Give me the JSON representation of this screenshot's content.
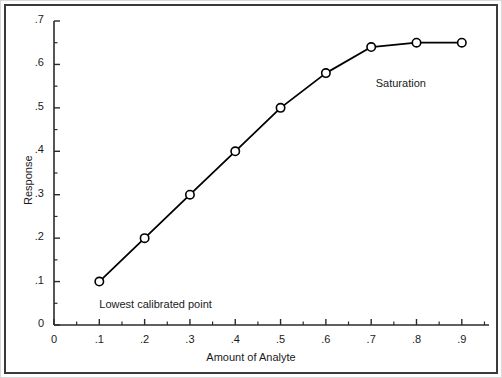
{
  "chart_data": {
    "type": "line",
    "title": "",
    "xlabel": "Amount of Analyte",
    "ylabel": "Response",
    "xlim": [
      0,
      0.96
    ],
    "ylim": [
      0,
      0.7
    ],
    "grid": false,
    "legend": null,
    "marker": "open-circle",
    "line_color": "#000000",
    "x": [
      0.1,
      0.2,
      0.3,
      0.4,
      0.5,
      0.6,
      0.7,
      0.8,
      0.9
    ],
    "values": [
      0.1,
      0.2,
      0.3,
      0.4,
      0.5,
      0.58,
      0.64,
      0.65,
      0.65
    ],
    "series": [
      {
        "name": "Calibration curve",
        "x": [
          0.1,
          0.2,
          0.3,
          0.4,
          0.5,
          0.6,
          0.7,
          0.8,
          0.9
        ],
        "values": [
          0.1,
          0.2,
          0.3,
          0.4,
          0.5,
          0.58,
          0.64,
          0.65,
          0.65
        ]
      }
    ],
    "xticks": [
      0,
      0.1,
      0.2,
      0.3,
      0.4,
      0.5,
      0.6,
      0.7,
      0.8,
      0.9
    ],
    "xticklabels": [
      "0",
      ".1",
      ".2",
      ".3",
      ".4",
      ".5",
      ".6",
      ".7",
      ".8",
      ".9"
    ],
    "xminorticks": [
      0.05,
      0.15,
      0.25,
      0.35,
      0.45,
      0.55,
      0.65,
      0.75,
      0.85,
      0.95
    ],
    "yticks": [
      0,
      0.1,
      0.2,
      0.3,
      0.4,
      0.5,
      0.6,
      0.7
    ],
    "yticklabels": [
      "0",
      ".1",
      ".2",
      ".3",
      ".4",
      ".5",
      ".6",
      ".7"
    ],
    "yminorticks": [
      0.05,
      0.15,
      0.25,
      0.35,
      0.45,
      0.55,
      0.65
    ],
    "annotations": [
      {
        "text": "Lowest calibrated point",
        "x": 0.1,
        "y": 0.045,
        "align": "left"
      },
      {
        "text": "Saturation",
        "x": 0.71,
        "y": 0.555,
        "align": "left"
      }
    ]
  }
}
